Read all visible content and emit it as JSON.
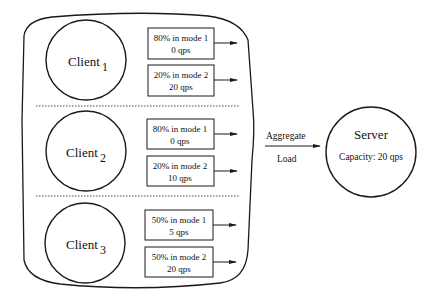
{
  "diagram": {
    "clients": [
      {
        "name": "Client",
        "index": "1",
        "modes": [
          {
            "line1": "80% in mode 1",
            "line2": "0  qps"
          },
          {
            "line1": "20% in mode 2",
            "line2": "20  qps"
          }
        ]
      },
      {
        "name": "Client",
        "index": "2",
        "modes": [
          {
            "line1": "80% in mode 1",
            "line2": "0  qps"
          },
          {
            "line1": "20% in mode 2",
            "line2": "10  qps"
          }
        ]
      },
      {
        "name": "Client",
        "index": "3",
        "modes": [
          {
            "line1": "50% in mode 1",
            "line2": "5  qps"
          },
          {
            "line1": "50% in mode 2",
            "line2": "20  qps"
          }
        ]
      }
    ],
    "aggregate": {
      "label_top": "Aggregate",
      "label_bottom": "Load"
    },
    "server": {
      "title": "Server",
      "capacity": "Capacity:  20 qps"
    }
  }
}
